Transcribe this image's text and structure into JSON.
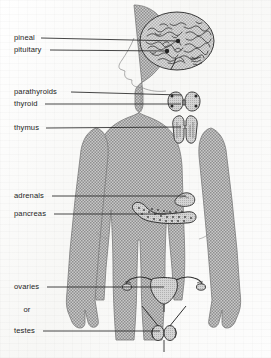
{
  "figure": {
    "kind": "anatomical-diagram",
    "body_outline_color": "#a9a9a9",
    "line_color": "#2b2b2b",
    "background_color": "#fcfcfc"
  },
  "labels": [
    {
      "id": "pineal",
      "text": "pineal",
      "x": 14,
      "y": 38,
      "leader_to_x": 178,
      "leader_to_y": 41
    },
    {
      "id": "pituitary",
      "text": "pituitary",
      "x": 14,
      "y": 50,
      "leader_to_x": 168,
      "leader_to_y": 51
    },
    {
      "id": "parathyroids",
      "text": "parathyroids",
      "x": 14,
      "y": 92,
      "leader_to_x": 181,
      "leader_to_y": 95
    },
    {
      "id": "thyroid",
      "text": "thyroid",
      "x": 14,
      "y": 104,
      "leader_to_x": 181,
      "leader_to_y": 104
    },
    {
      "id": "thymus",
      "text": "thymus",
      "x": 14,
      "y": 128,
      "leader_to_x": 181,
      "leader_to_y": 127
    },
    {
      "id": "adrenals",
      "text": "adrenals",
      "x": 14,
      "y": 196,
      "leader_to_x": 186,
      "leader_to_y": 196
    },
    {
      "id": "pancreas",
      "text": "pancreas",
      "x": 14,
      "y": 214,
      "leader_to_x": 166,
      "leader_to_y": 214
    },
    {
      "id": "ovaries",
      "text": "ovaries",
      "x": 14,
      "y": 287,
      "leader_to_x": 164,
      "leader_to_y": 287
    },
    {
      "id": "or",
      "text": "or",
      "x": 26,
      "y": 310,
      "leader_to_x": null,
      "leader_to_y": null
    },
    {
      "id": "testes",
      "text": "testes",
      "x": 14,
      "y": 331,
      "leader_to_x": 160,
      "leader_to_y": 331
    }
  ],
  "organs": [
    {
      "id": "brain",
      "name": "brain-with-pineal-and-pituitary"
    },
    {
      "id": "thyroid",
      "name": "thyroid-gland"
    },
    {
      "id": "parathyroids",
      "name": "parathyroid-glands"
    },
    {
      "id": "thymus",
      "name": "thymus-gland"
    },
    {
      "id": "adrenals",
      "name": "adrenal-gland"
    },
    {
      "id": "pancreas",
      "name": "pancreas"
    },
    {
      "id": "ovaries",
      "name": "uterus-ovaries-fallopian-tubes"
    },
    {
      "id": "testes",
      "name": "testes"
    }
  ]
}
